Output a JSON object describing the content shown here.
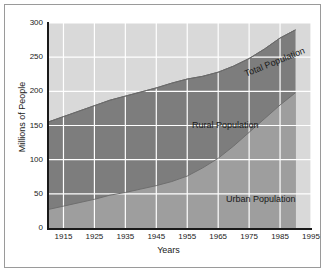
{
  "chart_data": {
    "type": "area",
    "title": "",
    "xlabel": "Years",
    "ylabel": "Millions of People",
    "xlim": [
      1910,
      1995
    ],
    "ylim": [
      0,
      300
    ],
    "xticks": [
      1915,
      1925,
      1935,
      1945,
      1955,
      1965,
      1975,
      1985,
      1995
    ],
    "yticks": [
      0,
      50,
      100,
      150,
      200,
      250,
      300
    ],
    "grid": true,
    "legend_position": "inline-annotations",
    "stacked": true,
    "data_end_year": 1990,
    "x": [
      1910,
      1915,
      1920,
      1925,
      1930,
      1935,
      1940,
      1945,
      1950,
      1955,
      1960,
      1965,
      1970,
      1975,
      1980,
      1985,
      1990
    ],
    "series": [
      {
        "name": "Urban Population",
        "color": "#9e9e9e",
        "values": [
          27,
          32,
          37,
          42,
          48,
          52,
          57,
          62,
          68,
          76,
          88,
          102,
          120,
          140,
          160,
          180,
          198
        ]
      },
      {
        "name": "Rural Population",
        "color": "#7d7d7d",
        "values": [
          128,
          131,
          134,
          137,
          139,
          141,
          142,
          143,
          144,
          142,
          134,
          126,
          117,
          108,
          102,
          98,
          92
        ]
      },
      {
        "name": "Total Population",
        "color": "#d9d9d9",
        "values": [
          155,
          163,
          171,
          179,
          187,
          193,
          199,
          205,
          212,
          218,
          222,
          228,
          237,
          248,
          262,
          278,
          290
        ]
      }
    ],
    "annotations": [
      {
        "text": "Total Population",
        "rotation": -22
      },
      {
        "text": "Rural Population",
        "rotation": 0
      },
      {
        "text": "Urban Population",
        "rotation": 0
      }
    ]
  },
  "axes": {
    "xlabel": "Years",
    "ylabel": "Millions of People",
    "xticks": [
      "1915",
      "1925",
      "1935",
      "1945",
      "1955",
      "1965",
      "1975",
      "1985",
      "1995"
    ],
    "yticks": [
      "300",
      "250",
      "200",
      "150",
      "100",
      "50",
      "0"
    ]
  },
  "labels": {
    "total": "Total Population",
    "rural": "Rural Population",
    "urban": "Urban Population"
  },
  "colors": {
    "total_band": "#d9d9d9",
    "rural_band": "#7d7d7d",
    "urban_band": "#9e9e9e",
    "gridline": "#ffffff",
    "axis": "#1a1a1a",
    "frame": "#9a9a9a",
    "background": "#ffffff"
  }
}
